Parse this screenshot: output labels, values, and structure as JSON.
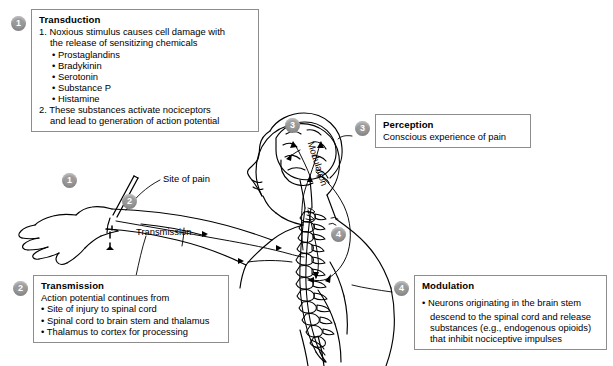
{
  "figure": {
    "background": "#ffffff",
    "badge_color": "#9a9a9a",
    "box_border_color": "#8d8d8d",
    "line_color": "#000000"
  },
  "labels": {
    "site_of_pain": "Site of pain",
    "transmission_arrow": "Transmission",
    "modulation_path": "Modulation"
  },
  "badges": {
    "one": "1",
    "two": "2",
    "three": "3",
    "four": "4",
    "figure_one": "1",
    "figure_two": "2",
    "figure_three": "3",
    "figure_four": "4"
  },
  "boxes": {
    "transduction": {
      "title": "Transduction",
      "item1": "1. Noxious stimulus causes cell damage with",
      "item1_cont": "the release of sensitizing chemicals",
      "chemicals": [
        "• Prostaglandins",
        "• Bradykinin",
        "• Serotonin",
        "• Substance P",
        "• Histamine"
      ],
      "item2": "2. These substances activate nociceptors",
      "item2_cont": "and lead to generation of action potential"
    },
    "transmission": {
      "title": "Transmission",
      "lead": "Action potential continues from",
      "steps": [
        "• Site of injury to spinal cord",
        "• Spinal cord to brain stem and thalamus",
        "• Thalamus to cortex for processing"
      ]
    },
    "perception": {
      "title": "Perception",
      "line": "Conscious experience of pain"
    },
    "modulation": {
      "title": "Modulation",
      "bullet_l1": "• Neurons originating in the brain stem",
      "bullet_l2": "descend to the spinal cord and release",
      "bullet_l3": "substances (e.g., endogenous opioids)",
      "bullet_l4": "that inhibit nociceptive impulses"
    }
  }
}
